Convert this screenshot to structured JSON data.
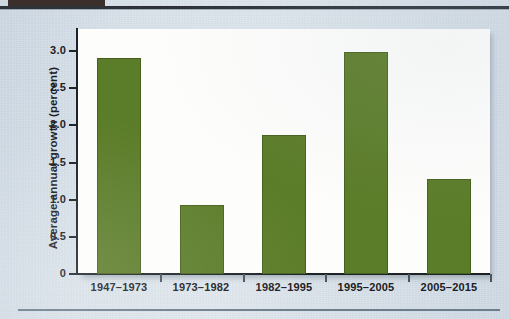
{
  "page": {
    "background_color": "#d6dfe8",
    "top_tab_color": "#3a2f2a",
    "rule_color": "#2c3238",
    "bottom_rule_color": "#6c7d8c"
  },
  "chart_data": {
    "type": "bar",
    "title": "",
    "subtitle": "",
    "xlabel": "",
    "ylabel": "Average annual growth (percent)",
    "categories": [
      "1947–1973",
      "1973–1982",
      "1982–1995",
      "1995–2005",
      "2005–2015"
    ],
    "values": [
      2.9,
      0.93,
      1.87,
      2.98,
      1.28
    ],
    "series": [
      {
        "name": "Average annual growth",
        "color": "#5b7c28",
        "values": [
          2.9,
          0.93,
          1.87,
          2.98,
          1.28
        ]
      }
    ],
    "ylim": [
      0,
      3.25
    ],
    "yticks": [
      0,
      0.5,
      1.0,
      1.5,
      2.0,
      2.5,
      3.0
    ],
    "ytick_labels": [
      "0",
      "0.5",
      "1.0",
      "1.5",
      "2.0",
      "2.5",
      "3.0"
    ],
    "grid": false,
    "legend": false,
    "legend_position": "none",
    "bar_color": "#5b7c28",
    "bar_edge_color": "#46611d",
    "plot_background": "#fdfdfb",
    "axis_color": "#1d2227"
  }
}
